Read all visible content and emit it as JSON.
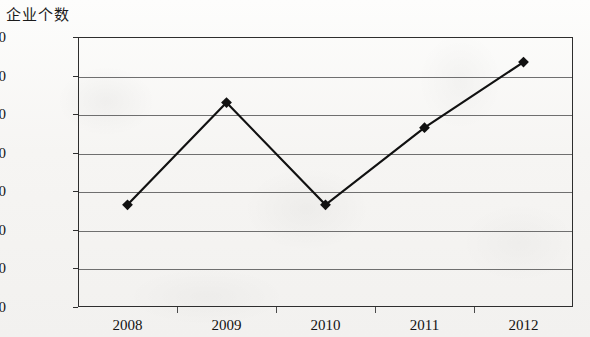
{
  "chart_data": {
    "type": "line",
    "title": "企业个数",
    "xlabel": "",
    "ylabel": "企业个数",
    "categories": [
      "2008",
      "2009",
      "2010",
      "2011",
      "2012"
    ],
    "values": [
      14650,
      17300,
      14650,
      16650,
      18350
    ],
    "series": [
      {
        "name": "企业个数",
        "values": [
          14650,
          17300,
          14650,
          16650,
          18350
        ]
      }
    ],
    "ylim": [
      12000,
      19000
    ],
    "ytick_step": 1000,
    "yticks": [
      19000,
      18000,
      17000,
      16000,
      15000,
      14000,
      13000,
      12000
    ],
    "ytick_labels": [
      "19000",
      "18000",
      "17000",
      "16000",
      "15000",
      "14000",
      "13000",
      "12000"
    ],
    "grid": true,
    "grid_axis": "y",
    "legend": false,
    "legend_position": "none",
    "marker": "diamond",
    "line_color": "#111111",
    "marker_color": "#111111",
    "grid_color": "#6f6f6f",
    "axis_color": "#2e2e2e",
    "background_color": "#f5f4f2",
    "annotations": []
  }
}
